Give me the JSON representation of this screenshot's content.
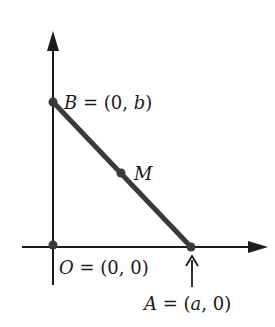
{
  "diagram": {
    "colors": {
      "ink": "#1a1a1a",
      "segment": "#3a3a3a",
      "background": "#ffffff"
    },
    "points": [
      {
        "name": "B",
        "label_prefix": "B",
        "label_rest": " = (0, ",
        "label_var": "b",
        "label_close": ")"
      },
      {
        "name": "M",
        "label": "M"
      },
      {
        "name": "O",
        "label_prefix": "O",
        "label_rest": " = (0, 0)"
      },
      {
        "name": "A",
        "label_prefix": "A",
        "label_rest": " = (",
        "label_var": "a",
        "label_close": ", 0)"
      }
    ]
  }
}
